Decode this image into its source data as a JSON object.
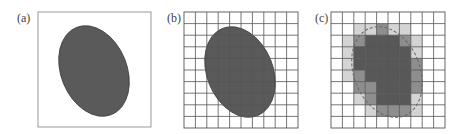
{
  "figure": {
    "panels": [
      {
        "id": "a",
        "label": "(a)",
        "description": "Continuous ellipse shape",
        "frame": {
          "x": 38,
          "y": 12,
          "w": 113,
          "h": 115
        },
        "ellipse": {
          "cx": 94,
          "cy": 71,
          "rx": 33,
          "ry": 47,
          "rotate": -22
        },
        "label_pos": {
          "x": 17,
          "y": 12
        }
      },
      {
        "id": "b",
        "label": "(b)",
        "description": "Ellipse overlaid with 10x10 pixel grid",
        "frame": {
          "x": 184,
          "y": 12,
          "w": 114,
          "h": 116
        },
        "grid": {
          "cols": 10,
          "rows": 10
        },
        "ellipse": {
          "cx": 240,
          "cy": 72,
          "rx": 33,
          "ry": 47,
          "rotate": -22
        },
        "label_pos": {
          "x": 167,
          "y": 12
        }
      },
      {
        "id": "c",
        "label": "(c)",
        "description": "Rasterized ellipse: pixel intensities by coverage, original outline dashed",
        "frame": {
          "x": 331,
          "y": 12,
          "w": 114,
          "h": 116
        },
        "grid": {
          "cols": 10,
          "rows": 10
        },
        "ellipse": {
          "cx": 387,
          "cy": 72,
          "rx": 33,
          "ry": 47,
          "rotate": -22
        },
        "label_pos": {
          "x": 315,
          "y": 12
        },
        "pixel_levels": [
          [
            0,
            0,
            0,
            0,
            0,
            0,
            0,
            0,
            0,
            0
          ],
          [
            0,
            0,
            1,
            1,
            2,
            1,
            1,
            0,
            0,
            0
          ],
          [
            0,
            1,
            2,
            3,
            3,
            3,
            2,
            1,
            0,
            0
          ],
          [
            0,
            1,
            3,
            3,
            3,
            3,
            3,
            1,
            0,
            0
          ],
          [
            0,
            1,
            3,
            3,
            3,
            3,
            3,
            2,
            0,
            0
          ],
          [
            0,
            1,
            2,
            3,
            3,
            3,
            3,
            2,
            0,
            0
          ],
          [
            0,
            0,
            2,
            2,
            3,
            3,
            3,
            2,
            0,
            0
          ],
          [
            0,
            0,
            1,
            2,
            3,
            3,
            3,
            1,
            0,
            0
          ],
          [
            0,
            0,
            0,
            1,
            2,
            2,
            2,
            1,
            0,
            0
          ],
          [
            0,
            0,
            0,
            0,
            0,
            0,
            0,
            0,
            0,
            0
          ]
        ]
      }
    ],
    "colors": {
      "ellipse_fill": "#5a5a5a",
      "ellipse_stroke": "#3a3a3a",
      "frame": "#999999",
      "grid_line": "#555555",
      "dashed_outline": "#666666",
      "levels": [
        "#ffffff",
        "#d4d4d4",
        "#8e8e8e",
        "#585858"
      ]
    }
  }
}
